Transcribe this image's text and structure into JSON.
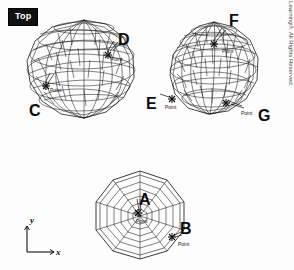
{
  "viewport": {
    "badge_label": "Top",
    "background_color": "#fdfdfd",
    "line_color": "#1a1a1a"
  },
  "axis_indicator": {
    "name": "ucs-icon",
    "x_label": "x",
    "y_label": "y"
  },
  "callouts": [
    {
      "id": "A",
      "label": "A",
      "x": 139,
      "y": 192,
      "target": "top-view-center-point"
    },
    {
      "id": "B",
      "label": "B",
      "x": 180,
      "y": 221,
      "target": "top-view-edge-point"
    },
    {
      "id": "C",
      "label": "C",
      "x": 29,
      "y": 103,
      "target": "left-sphere-lower-left-point"
    },
    {
      "id": "D",
      "label": "D",
      "x": 118,
      "y": 32,
      "target": "left-sphere-upper-right-point"
    },
    {
      "id": "E",
      "label": "E",
      "x": 146,
      "y": 96,
      "target": "right-sphere-left-point"
    },
    {
      "id": "F",
      "label": "F",
      "x": 229,
      "y": 13,
      "target": "right-sphere-top-point"
    },
    {
      "id": "G",
      "label": "G",
      "x": 258,
      "y": 108,
      "target": "right-sphere-bottom-right-point"
    }
  ],
  "osnap_markers": [
    {
      "label": "Point",
      "x": 50,
      "y": 88,
      "parent": "left-sphere"
    },
    {
      "label": "Point",
      "x": 111,
      "y": 57,
      "parent": "left-sphere"
    },
    {
      "label": "Point",
      "x": 165,
      "y": 105,
      "parent": "right-sphere"
    },
    {
      "label": "Point",
      "x": 222,
      "y": 49,
      "parent": "right-sphere"
    },
    {
      "label": "Point",
      "x": 241,
      "y": 111,
      "parent": "right-sphere"
    },
    {
      "label": "Point",
      "x": 136,
      "y": 219,
      "parent": "top-view-polygon"
    },
    {
      "label": "Point",
      "x": 178,
      "y": 242,
      "parent": "top-view-polygon"
    }
  ],
  "objects": [
    {
      "name": "left-sphere",
      "type": "wireframe-sphere",
      "cx": 84,
      "cy": 72,
      "rx": 57,
      "ry": 52
    },
    {
      "name": "right-sphere",
      "type": "wireframe-sphere",
      "cx": 214,
      "cy": 68,
      "rx": 45,
      "ry": 48
    },
    {
      "name": "top-view-polygon",
      "type": "wireframe-sphere-top-view",
      "cx": 140,
      "cy": 215,
      "rx": 46,
      "ry": 44
    }
  ],
  "copyright": {
    "text": "© 2014 Cengage Learning®. All Rights Reserved."
  }
}
